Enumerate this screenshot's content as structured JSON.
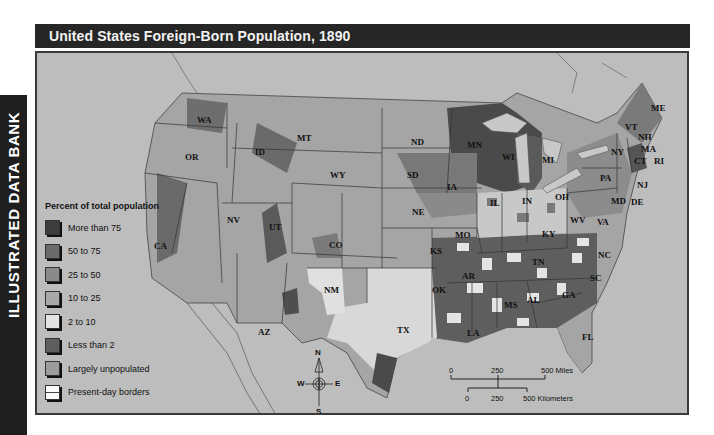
{
  "side_tab": {
    "label": "ILLUSTRATED DATA BANK"
  },
  "title": "United States Foreign-Born Population, 1890",
  "legend": {
    "title": "Percent of total population",
    "items": [
      {
        "label": "More than 75",
        "color": "#3d3d3d"
      },
      {
        "label": "50 to 75",
        "color": "#6a6a6a"
      },
      {
        "label": "25 to 50",
        "color": "#8a8a8a"
      },
      {
        "label": "10 to 25",
        "color": "#a8a8a8"
      },
      {
        "label": "2 to 10",
        "color": "#e4e4e4"
      },
      {
        "label": "Less than  2",
        "color": "#5e5e5e"
      },
      {
        "label": "Largely unpopulated",
        "color": "#9c9c9c"
      },
      {
        "label": "Present-day borders",
        "color": "#fafafa"
      }
    ]
  },
  "compass": {
    "n": "N",
    "s": "S",
    "e": "E",
    "w": "W"
  },
  "scale": {
    "miles": {
      "ticks": [
        "0",
        "250",
        "500 Miles"
      ]
    },
    "kilometers": {
      "ticks": [
        "0",
        "250",
        "500 Kilometers"
      ]
    }
  },
  "states": [
    "WA",
    "OR",
    "CA",
    "ID",
    "NV",
    "MT",
    "WY",
    "UT",
    "AZ",
    "CO",
    "NM",
    "ND",
    "SD",
    "NE",
    "KS",
    "OK",
    "TX",
    "MN",
    "IA",
    "MO",
    "AR",
    "LA",
    "WI",
    "IL",
    "MI",
    "IN",
    "OH",
    "KY",
    "TN",
    "MS",
    "AL",
    "GA",
    "FL",
    "SC",
    "NC",
    "VA",
    "WV",
    "PA",
    "NY",
    "MD",
    "DE",
    "NJ",
    "VT",
    "NH",
    "ME",
    "MA",
    "CT",
    "RI"
  ],
  "colors": {
    "background": "#bdbdbd",
    "title_bar": "#262626",
    "side_tab": "#1e1e1e",
    "water": "#c6c6c6"
  }
}
